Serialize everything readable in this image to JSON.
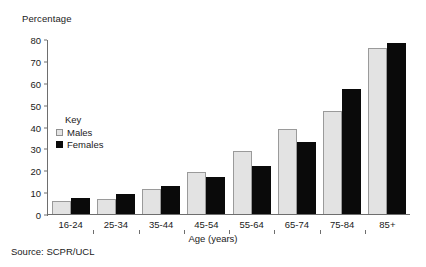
{
  "chart_data": {
    "type": "bar",
    "title": "",
    "ylabel": "Percentage",
    "xlabel": "Age (years)",
    "categories": [
      "16-24",
      "25-34",
      "35-44",
      "45-54",
      "55-64",
      "65-74",
      "75-84",
      "85+"
    ],
    "series": [
      {
        "name": "Males",
        "color": "#e3e3e3",
        "values": [
          6,
          7,
          11.5,
          19,
          29,
          39,
          47,
          76
        ]
      },
      {
        "name": "Females",
        "color": "#0a0a0a",
        "values": [
          7.5,
          9,
          13,
          17,
          22,
          33,
          57,
          78
        ]
      }
    ],
    "ylim": [
      0,
      80
    ],
    "yticks": [
      0,
      10,
      20,
      30,
      40,
      50,
      60,
      70,
      80
    ],
    "ytick_labels": [
      "0",
      "10",
      "20",
      "30",
      "40",
      "50",
      "60",
      "70",
      "80"
    ],
    "grid": false,
    "legend_position": "inside-upper-left"
  },
  "legend": {
    "title": "Key",
    "entries": [
      {
        "label": "Males"
      },
      {
        "label": "Females"
      }
    ]
  },
  "footer": {
    "source": "Source: SCPR/UCL"
  }
}
